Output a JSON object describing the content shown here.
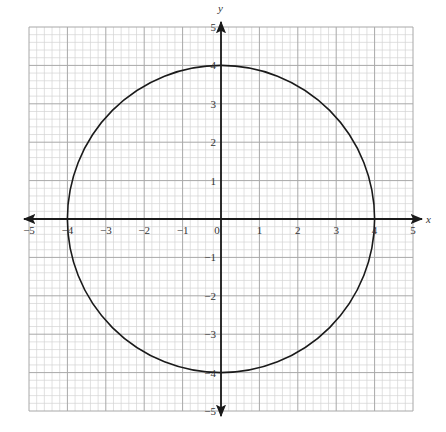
{
  "chart_data": {
    "type": "line",
    "title": "",
    "xlabel": "x",
    "ylabel": "y",
    "xlim": [
      -5,
      5
    ],
    "ylim": [
      -5,
      5
    ],
    "grid": true,
    "grid_minor_step": 0.2,
    "grid_major_step": 1,
    "x_ticks": [
      -5,
      -4,
      -3,
      -2,
      -1,
      0,
      1,
      2,
      3,
      4,
      5
    ],
    "y_ticks": [
      -5,
      -4,
      -3,
      -2,
      -1,
      1,
      2,
      3,
      4,
      5
    ],
    "x_tick_labels": [
      "−5",
      "−4",
      "−3",
      "−2",
      "−1",
      "0",
      "1",
      "2",
      "3",
      "4",
      "5"
    ],
    "y_tick_labels": [
      "−5",
      "−4",
      "−3",
      "−2",
      "−1",
      "1",
      "2",
      "3",
      "4",
      "5"
    ],
    "series": [
      {
        "name": "circle",
        "shape": "circle",
        "center": [
          0,
          0
        ],
        "radius": 4,
        "equation": "x^2 + y^2 = 16",
        "key_points": [
          [
            4,
            0
          ],
          [
            0,
            4
          ],
          [
            -4,
            0
          ],
          [
            0,
            -4
          ]
        ]
      }
    ],
    "legend": null
  },
  "colors": {
    "grid_minor": "#d4d4d4",
    "grid_major": "#a8a8a8",
    "axis": "#1a1a1a",
    "curve": "#1a1a1a"
  }
}
